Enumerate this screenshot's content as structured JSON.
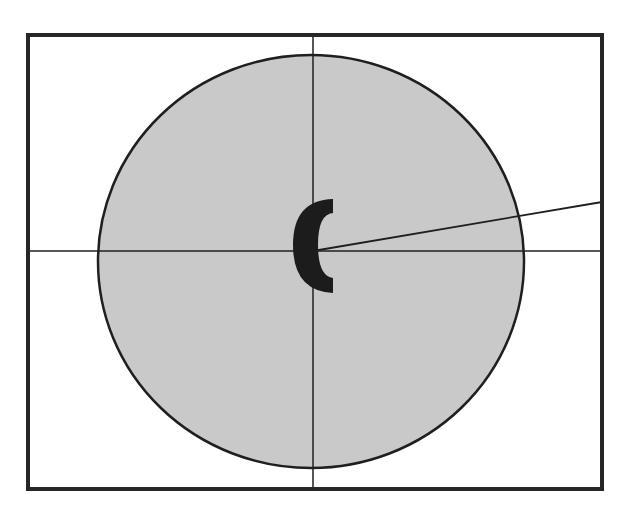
{
  "diagram": {
    "type": "geometric-figure",
    "frame": {
      "x": 28,
      "y": 35,
      "width": 574,
      "height": 454,
      "stroke": "#262626",
      "stroke_width": 4
    },
    "ellipse": {
      "cx": 311,
      "cy": 261.5,
      "rx": 213,
      "ry": 206.5,
      "fill": "#c9c9c9",
      "stroke": "#1f1f1f",
      "stroke_width": 2.5
    },
    "crosshair": {
      "vertical": {
        "x": 313,
        "y1": 35,
        "y2": 489
      },
      "horizontal": {
        "y": 251,
        "x1": 28,
        "x2": 602
      },
      "stroke": "#1f1f1f",
      "stroke_width": 1.5
    },
    "radial_line": {
      "x1": 313,
      "y1": 251,
      "x2": 602,
      "y2": 202,
      "stroke": "#1f1f1f",
      "stroke_width": 1.8
    },
    "center_label": {
      "text": "(",
      "color": "#1c1c1c"
    }
  }
}
